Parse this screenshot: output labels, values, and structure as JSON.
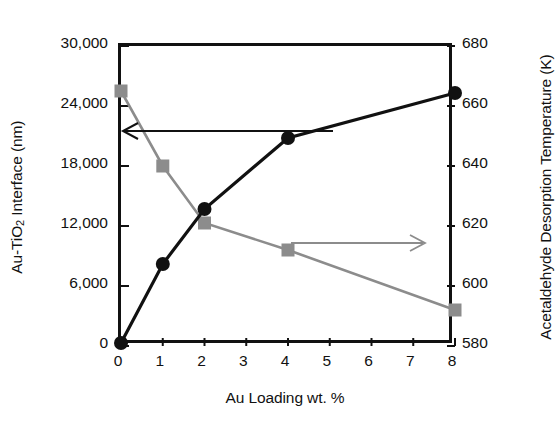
{
  "chart_data": {
    "type": "line",
    "title": "",
    "xlabel": "Au Loading wt. %",
    "x": [
      0,
      1,
      2,
      4,
      8
    ],
    "xticks": [
      "0",
      "1",
      "2",
      "3",
      "4",
      "5",
      "6",
      "7",
      "8"
    ],
    "xlim": [
      0,
      8
    ],
    "grid": false,
    "legend": "none",
    "annotations": [
      {
        "name": "left-arrow",
        "text": "",
        "points_to": "left-axis",
        "series": "Au-TiO2 Interface (nm)"
      },
      {
        "name": "right-arrow",
        "text": "",
        "points_to": "right-axis",
        "series": "Acetaldehyde Desorption Temperature (K)"
      }
    ],
    "axes": [
      {
        "side": "left",
        "ylabel": "Au-TiO2 Interface (nm)",
        "ylabel_parts": {
          "pre": "Au-TiO",
          "sub": "2",
          "post": " Interface (nm)"
        },
        "ylim": [
          0,
          30000
        ],
        "yticks": [
          "0",
          "6,000",
          "12,000",
          "18,000",
          "24,000",
          "30,000"
        ],
        "ytick_values": [
          0,
          6000,
          12000,
          18000,
          24000,
          30000
        ]
      },
      {
        "side": "right",
        "ylabel": "Acetaldehyde Desorption Temperature (K)",
        "ylim": [
          580,
          680
        ],
        "yticks": [
          "580",
          "600",
          "620",
          "640",
          "660",
          "680"
        ],
        "ytick_values": [
          580,
          600,
          620,
          640,
          660,
          680
        ]
      }
    ],
    "series": [
      {
        "name": "Au-TiO2 Interface (nm)",
        "axis": "left",
        "marker": "circle",
        "color": "#111111",
        "values": [
          300,
          8200,
          13700,
          20800,
          25300
        ]
      },
      {
        "name": "Acetaldehyde Desorption Temperature (K)",
        "axis": "right",
        "marker": "square",
        "color": "#8c8c8c",
        "values": [
          665,
          640,
          621,
          612,
          592
        ]
      }
    ]
  }
}
